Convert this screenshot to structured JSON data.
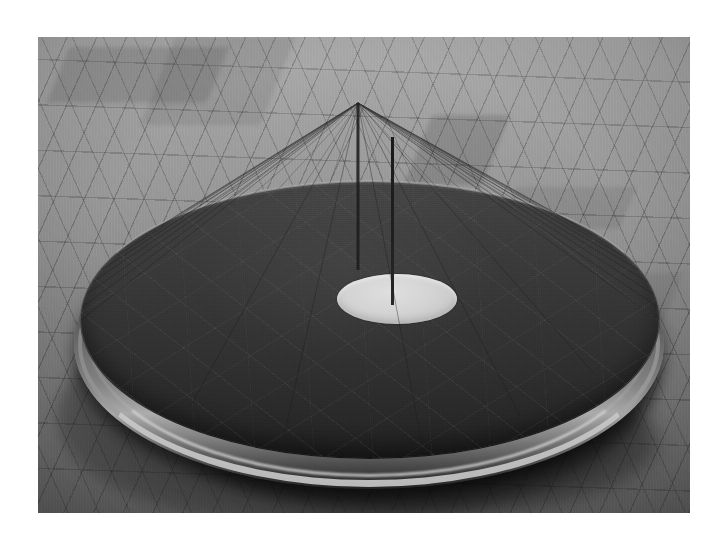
{
  "image": {
    "kind": "photograph",
    "medium": "black-and-white photograph",
    "subject": "large shallow metal disc sculpture with central aperture and radiating string fan",
    "orientation": "landscape",
    "canvas_width": 725,
    "canvas_height": 549,
    "plate": {
      "left": 38,
      "top": 37,
      "width": 652,
      "height": 476
    },
    "border_color": "#ffffff",
    "caption": ""
  },
  "palette": {
    "page_background": "#ffffff",
    "floor_light": "#a19f9b",
    "floor_mid": "#8e8c89",
    "floor_dark": "#7e7c78",
    "disc_face_dark": "#332f2d",
    "disc_face_light": "#4d4a46",
    "rim_metal_highlight": "#d6d0c6",
    "rim_metal_shadow": "#3a3835",
    "aperture_cream": "#d8d2c4",
    "string_dark": "#1e1c1b",
    "shadow": "#151413"
  },
  "scene": {
    "floor": {
      "label": "parquet herringbone wooden floor",
      "pattern": "herringbone",
      "plank_angle_deg": 114,
      "seam_spacing_px": 27
    },
    "shadow": {
      "label": "cast shadow beneath disc",
      "center_x": 318,
      "center_y": 363,
      "width": 600,
      "height": 250
    },
    "disc": {
      "label": "shallow circular metal disc",
      "surface_finish": "dark patinated sheet metal with radial score lines",
      "rim_finish": "polished metal band",
      "top_face": {
        "cx": 332,
        "cy": 283,
        "rx": 290,
        "ry": 139
      },
      "side_wall": {
        "cx": 331,
        "cy": 307,
        "rx": 295,
        "ry": 145
      },
      "score_lines": 3
    },
    "aperture": {
      "label": "central circular aperture",
      "cx": 325,
      "cy": 140,
      "rx": 60,
      "ry": 25,
      "tone": "cream highlight"
    },
    "mast": {
      "label": "central vertical mast",
      "apex_x": 358,
      "apex_y": 103,
      "base_x": 358,
      "base_y": 270,
      "width_px": 3
    },
    "string_fan": {
      "label": "radiating taut strings from apex to disc rim",
      "apex_x": 358,
      "apex_y": 103,
      "count": 34,
      "anchor_ellipse": {
        "cx": 332,
        "cy": 283,
        "rx": 289,
        "ry": 138
      },
      "stroke_color": "#1e1c1b",
      "stroke_width": 0.55
    }
  }
}
